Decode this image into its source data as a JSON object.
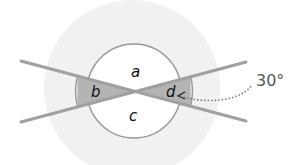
{
  "diagram": {
    "type": "intersecting-lines-angles",
    "angle_labels": {
      "top": "a",
      "left": "b",
      "bottom": "c",
      "right": "d"
    },
    "annotation": {
      "text": "30°",
      "points_to": "d"
    },
    "colors": {
      "background_disc": "#f1f1f1",
      "circle_stroke": "#9a9a9a",
      "line_stroke": "#a0a0a0",
      "shaded_sector": "#b4b4b4",
      "label_text": "#111111",
      "annotation_text": "#555555"
    }
  }
}
